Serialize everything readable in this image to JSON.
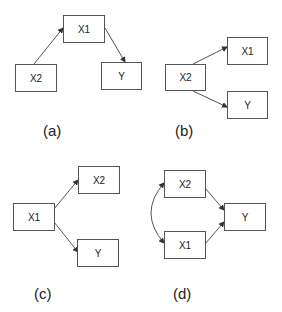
{
  "diagrams": [
    {
      "id": "a",
      "caption": "(a)",
      "nodes": {
        "X1": "X1",
        "X2": "X2",
        "Y": "Y"
      },
      "edges": [
        "X2->X1",
        "X1->Y"
      ]
    },
    {
      "id": "b",
      "caption": "(b)",
      "nodes": {
        "X1": "X1",
        "X2": "X2",
        "Y": "Y"
      },
      "edges": [
        "X2->X1",
        "X2->Y"
      ]
    },
    {
      "id": "c",
      "caption": "(c)",
      "nodes": {
        "X1": "X1",
        "X2": "X2",
        "Y": "Y"
      },
      "edges": [
        "X1->X2",
        "X1->Y"
      ]
    },
    {
      "id": "d",
      "caption": "(d)",
      "nodes": {
        "X1": "X1",
        "X2": "X2",
        "Y": "Y"
      },
      "edges": [
        "X2->Y",
        "X1->Y",
        "X1<->X2"
      ]
    }
  ],
  "colors": {
    "stroke": "#555555",
    "text": "#222222"
  }
}
